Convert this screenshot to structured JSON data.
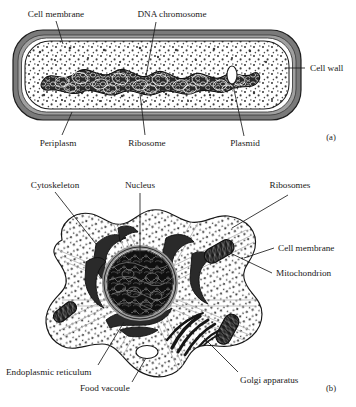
{
  "figure": {
    "title_absent": true,
    "panels": [
      {
        "id": "a",
        "marker": "(a)",
        "subject": "prokaryotic-bacterial-cell",
        "labels": [
          {
            "name": "cell-membrane",
            "text": "Cell membrane"
          },
          {
            "name": "dna-chromosome",
            "text": "DNA chromosome"
          },
          {
            "name": "cell-wall",
            "text": "Cell wall"
          },
          {
            "name": "periplasm",
            "text": "Periplasm"
          },
          {
            "name": "ribosome",
            "text": "Ribosome"
          },
          {
            "name": "plasmid",
            "text": "Plasmid"
          }
        ]
      },
      {
        "id": "b",
        "marker": "(b)",
        "subject": "eukaryotic-cell",
        "labels": [
          {
            "name": "cytoskeleton",
            "text": "Cytoskeleton"
          },
          {
            "name": "nucleus",
            "text": "Nucleus"
          },
          {
            "name": "ribosomes",
            "text": "Ribosomes"
          },
          {
            "name": "cell-membrane",
            "text": "Cell membrane"
          },
          {
            "name": "mitochondrion",
            "text": "Mitochondrion"
          },
          {
            "name": "endoplasmic-reticulum",
            "text": "Endoplasmic reticulum"
          },
          {
            "name": "food-vacuole",
            "text": "Food vacoule"
          },
          {
            "name": "golgi-apparatus",
            "text": "Golgi apparatus"
          }
        ]
      }
    ]
  },
  "colors": {
    "background": "#ffffff",
    "ink": "#1a1a1a",
    "cell_wall_gray": "#767676",
    "cell_wall_gray_light": "#9a9a9a",
    "cytoplasm": "#ffffff",
    "stipple": "#4a4a4a",
    "nucleus_fill": "#141414",
    "nuclear_envelope": "#8d8d8d",
    "organelle_dark": "#1f1f1f",
    "cytoskeleton_line": "#b0b0b0"
  },
  "typography": {
    "label_font_size_px": 9.2,
    "marker_font_size_px": 8.6
  }
}
